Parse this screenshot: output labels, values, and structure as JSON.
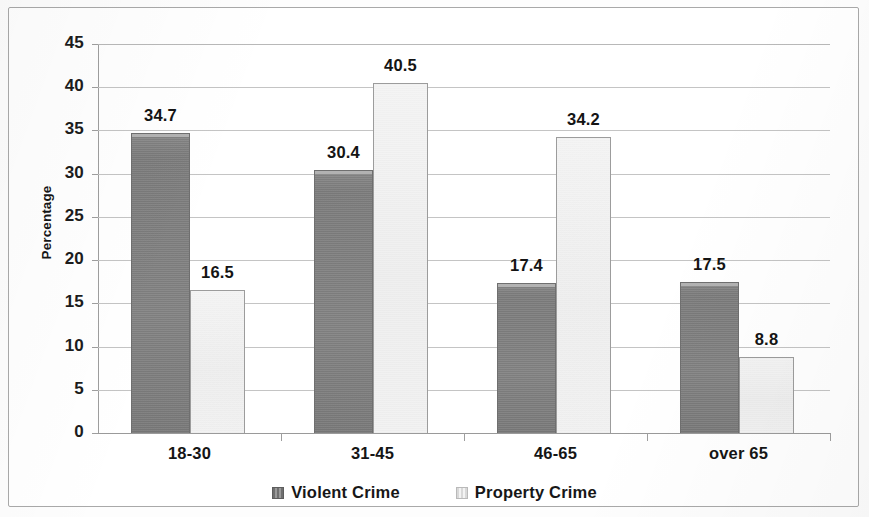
{
  "chart_data": {
    "type": "bar",
    "title": "",
    "subtitle": "",
    "xlabel": "",
    "ylabel": "Percentage",
    "categories": [
      "18-30",
      "31-45",
      "46-65",
      "over 65"
    ],
    "series": [
      {
        "name": "Violent Crime",
        "color": "#808080",
        "values": [
          34.7,
          30.4,
          17.4,
          17.5
        ],
        "value_labels": [
          "34.7",
          "30.4",
          "17.4",
          "17.5"
        ]
      },
      {
        "name": "Property Crime",
        "color": "#f0f0f0",
        "values": [
          16.5,
          40.5,
          34.2,
          8.8
        ],
        "value_labels": [
          "16.5",
          "40.5",
          "34.2",
          "8.8"
        ]
      }
    ],
    "ylim": [
      0,
      45
    ],
    "ytick_labels": [
      "45",
      "40",
      "35",
      "30",
      "25",
      "20",
      "15",
      "10",
      "5",
      "0"
    ],
    "ytick_values": [
      45,
      40,
      35,
      30,
      25,
      20,
      15,
      10,
      5,
      0
    ],
    "grid": true,
    "legend_position": "bottom",
    "legend_entries": [
      "Violent Crime",
      "Property Crime"
    ]
  },
  "axes": {
    "y_title": "Percentage"
  },
  "legend": {
    "items": [
      {
        "label": "Violent Crime",
        "swatch": "violent-crime-swatch-icon"
      },
      {
        "label": "Property Crime",
        "swatch": "property-crime-swatch-icon"
      }
    ]
  },
  "colors": {
    "violent_bar": "#808080",
    "property_bar": "#f0f0f0",
    "gridline": "#c4c4c4",
    "axis": "#9e9e9e",
    "frame_border": "#a9a9a9",
    "text": "#151515",
    "background": "#ffffff"
  }
}
